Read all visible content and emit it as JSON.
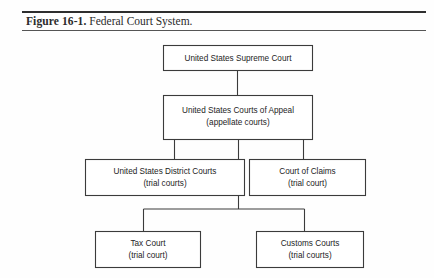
{
  "caption": {
    "label": "Figure 16-1.",
    "title": "Federal Court System."
  },
  "diagram": {
    "type": "hierarchy",
    "orientation": "top-down",
    "colors": {
      "line": "#3b3b3b",
      "box_fill": "#ffffff",
      "text": "#1d1d1d",
      "rule": "#2e2e2e",
      "page": "#fefefe"
    },
    "nodes": [
      {
        "id": "supreme-court",
        "title": "United States Supreme Court",
        "subtitle": "",
        "level": 1
      },
      {
        "id": "courts-of-appeal",
        "title": "United States Courts of Appeal",
        "subtitle": "(appellate courts)",
        "level": 2
      },
      {
        "id": "district-courts",
        "title": "United States District Courts",
        "subtitle": "(trial courts)",
        "level": 3
      },
      {
        "id": "court-of-claims",
        "title": "Court of Claims",
        "subtitle": "(trial court)",
        "level": 3
      },
      {
        "id": "tax-court",
        "title": "Tax Court",
        "subtitle": "(trial court)",
        "level": 4
      },
      {
        "id": "customs-courts",
        "title": "Customs Courts",
        "subtitle": "(trial courts)",
        "level": 4
      }
    ],
    "edges": [
      {
        "from": "supreme-court",
        "to": "courts-of-appeal"
      },
      {
        "from": "courts-of-appeal",
        "to": "district-courts"
      },
      {
        "from": "courts-of-appeal",
        "to": "court-of-claims"
      },
      {
        "from": "courts-of-appeal",
        "to": "lower-bus"
      },
      {
        "from": "lower-bus",
        "to": "tax-court"
      },
      {
        "from": "lower-bus",
        "to": "customs-courts"
      }
    ]
  }
}
